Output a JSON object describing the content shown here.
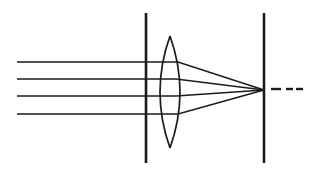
{
  "figure": {
    "background_color": "#ffffff",
    "line_color": "#1b1b1b",
    "width": 311,
    "height": 172
  },
  "chart_data": {
    "type": "diagram",
    "xlabel": "",
    "ylabel": "",
    "xlim": [
      0,
      311
    ],
    "ylim": [
      0,
      172
    ],
    "grid": false,
    "legend": "none",
    "elements": [
      {
        "name": "incoming-ray-1",
        "kind": "polyline",
        "style": "solid",
        "points": [
          [
            17,
            62
          ],
          [
            178,
            62
          ],
          [
            264,
            90
          ]
        ]
      },
      {
        "name": "incoming-ray-2",
        "kind": "polyline",
        "style": "solid",
        "points": [
          [
            17,
            79
          ],
          [
            176,
            79
          ],
          [
            264,
            90
          ]
        ]
      },
      {
        "name": "incoming-ray-3",
        "kind": "polyline",
        "style": "solid",
        "points": [
          [
            17,
            96
          ],
          [
            176,
            96
          ],
          [
            264,
            90
          ]
        ]
      },
      {
        "name": "incoming-ray-4",
        "kind": "polyline",
        "style": "solid",
        "points": [
          [
            17,
            114
          ],
          [
            178,
            114
          ],
          [
            264,
            90
          ]
        ]
      },
      {
        "name": "aperture-stop-line",
        "kind": "vline",
        "style": "solid",
        "x": 146,
        "y_range": [
          13,
          163
        ]
      },
      {
        "name": "image-plane-line",
        "kind": "vline",
        "style": "solid",
        "x": 264,
        "y_range": [
          13,
          163
        ]
      },
      {
        "name": "lens-left-surface",
        "kind": "arc",
        "style": "solid",
        "apex_top": [
          170,
          36
        ],
        "apex_bottom": [
          170,
          148
        ],
        "bulge_x": 160
      },
      {
        "name": "lens-right-surface",
        "kind": "arc",
        "style": "solid",
        "apex_top": [
          170,
          36
        ],
        "apex_bottom": [
          170,
          148
        ],
        "bulge_x": 180
      },
      {
        "name": "virtual-ray-extension",
        "kind": "dashed-line",
        "style": "dashed",
        "dashes": [
          [
            271,
            89,
            281,
            89
          ],
          [
            286,
            89,
            293,
            89
          ],
          [
            296,
            89,
            303,
            89
          ]
        ]
      }
    ],
    "focal_point": [
      264,
      90
    ],
    "lens_center": [
      170,
      92
    ],
    "ray_count": 4
  }
}
